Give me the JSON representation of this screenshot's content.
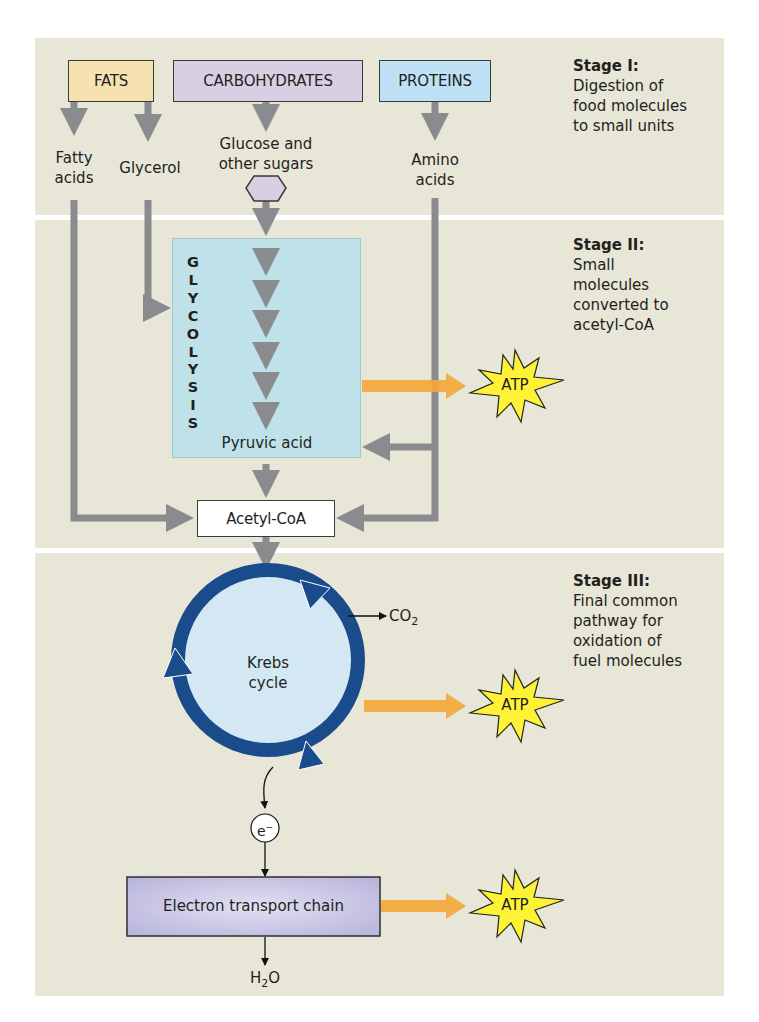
{
  "colors": {
    "panel_bg": "#e8e6d6",
    "fats": "#f5e2b0",
    "carbohydrates": "#d8cfe2",
    "proteins": "#bde0f5",
    "glycolysis_box": "#bfe2ea",
    "krebs_ring": "#1a4c8c",
    "krebs_fill": "#d4e8f4",
    "atp_star": "#fdf235",
    "energy_arrow": "#f2a83a",
    "flow_arrow": "#8a8b8e",
    "etc_box": "#c8c6e4"
  },
  "sources": {
    "fats": "FATS",
    "carbohydrates": "CARBOHYDRATES",
    "proteins": "PROTEINS"
  },
  "products": {
    "fatty_acids_1": "Fatty",
    "fatty_acids_2": "acids",
    "glycerol": "Glycerol",
    "glucose_1": "Glucose and",
    "glucose_2": "other sugars",
    "amino_1": "Amino",
    "amino_2": "acids"
  },
  "glycolysis": {
    "letters": [
      "G",
      "L",
      "Y",
      "C",
      "O",
      "L",
      "Y",
      "S",
      "I",
      "S"
    ],
    "label": "GLYCOLYSIS",
    "end_product": "Pyruvic acid"
  },
  "acetyl_coa": "Acetyl-CoA",
  "krebs": {
    "line1": "Krebs",
    "line2": "cycle",
    "co2": "CO",
    "co2_sub": "2"
  },
  "electron": {
    "symbol": "e",
    "charge": "−"
  },
  "etc": {
    "label": "Electron transport chain",
    "water": "H",
    "water_sub": "2",
    "water_end": "O"
  },
  "atp": {
    "label": "ATP"
  },
  "stages": [
    {
      "title": "Stage I:",
      "lines": [
        "Digestion of",
        "food molecules",
        "to small units"
      ]
    },
    {
      "title": "Stage II:",
      "lines": [
        "Small",
        "molecules",
        "converted to",
        "acetyl-CoA"
      ]
    },
    {
      "title": "Stage III:",
      "lines": [
        "Final common",
        "pathway for",
        "oxidation of",
        "fuel molecules"
      ]
    }
  ]
}
